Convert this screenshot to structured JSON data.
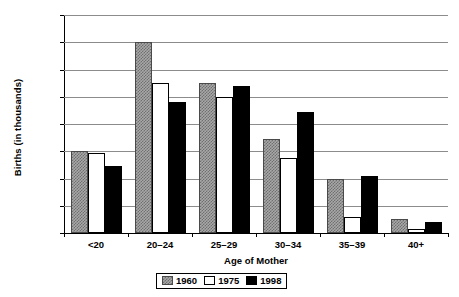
{
  "chart_data": {
    "type": "bar",
    "title": "",
    "xlabel": "Age of Mother",
    "ylabel": "Births (in thousands)",
    "categories": [
      "<20",
      "20–24",
      "25–29",
      "30–34",
      "35–39",
      "40+"
    ],
    "series": [
      {
        "name": "1960",
        "values": [
          600,
          1400,
          1100,
          690,
          395,
          100
        ]
      },
      {
        "name": "1975",
        "values": [
          590,
          1100,
          1000,
          550,
          115,
          30
        ]
      },
      {
        "name": "1998",
        "values": [
          490,
          960,
          1080,
          890,
          415,
          80
        ]
      }
    ],
    "ylim": [
      0,
      1600
    ],
    "ytick_labels": [
      "0",
      "200",
      "400",
      "600",
      "800",
      "1000",
      "1200",
      "1400",
      "1600"
    ],
    "ytick_values": [
      0,
      200,
      400,
      600,
      800,
      1000,
      1200,
      1400,
      1600
    ],
    "grid": true,
    "legend_position": "bottom-center",
    "series_styles": [
      {
        "name": "1960",
        "fill": "#a8a8a8",
        "pattern": "checkered",
        "edge": "#4a4a4a"
      },
      {
        "name": "1975",
        "fill": "#ffffff",
        "pattern": "solid",
        "edge": "#000000"
      },
      {
        "name": "1998",
        "fill": "#000000",
        "pattern": "solid",
        "edge": "#000000"
      }
    ]
  },
  "axis": {
    "y_title": "Births (in thousands)",
    "x_title": "Age of Mother"
  },
  "legend": {
    "items": [
      {
        "label": "1960"
      },
      {
        "label": "1975"
      },
      {
        "label": "1998"
      }
    ]
  }
}
